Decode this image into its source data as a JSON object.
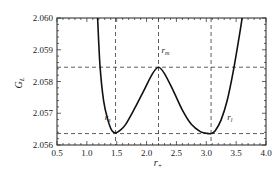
{
  "chart_data": {
    "type": "line",
    "title": "",
    "xlabel": "r+",
    "xlabel_main": "r",
    "xlabel_sub": "+",
    "ylabel": "GL",
    "ylabel_main": "G",
    "ylabel_sub": "L",
    "xlim": [
      0.5,
      4.0
    ],
    "ylim": [
      2.056,
      2.06
    ],
    "xticks": [
      "0.5",
      "1.0",
      "1.5",
      "2.0",
      "2.5",
      "3.0",
      "3.5",
      "4.0"
    ],
    "yticks": [
      "2.060",
      "2.059",
      "2.058",
      "2.057",
      "2.056"
    ],
    "grid": false,
    "legend": null,
    "series": [
      {
        "name": "G_L(r+)",
        "x": [
          1.18,
          1.22,
          1.28,
          1.35,
          1.42,
          1.48,
          1.55,
          1.65,
          1.8,
          1.95,
          2.1,
          2.2,
          2.3,
          2.45,
          2.6,
          2.75,
          2.9,
          3.0,
          3.08,
          3.15,
          3.25,
          3.35,
          3.45,
          3.55,
          3.6
        ],
        "y": [
          2.06,
          2.0585,
          2.0574,
          2.0568,
          2.05645,
          2.05638,
          2.05645,
          2.05665,
          2.05715,
          2.0577,
          2.05825,
          2.05845,
          2.05825,
          2.0577,
          2.0571,
          2.05665,
          2.05642,
          2.05637,
          2.05636,
          2.05645,
          2.0568,
          2.0574,
          2.0583,
          2.0594,
          2.06
        ]
      }
    ],
    "reference_lines": {
      "vertical_x": [
        1.48,
        2.2,
        3.08
      ],
      "horizontal_y": [
        2.05845,
        2.05636
      ],
      "style": "dashed"
    },
    "annotations": [
      {
        "text": "r_s",
        "main": "r",
        "sub": "s",
        "x": 1.3,
        "y": 2.0568
      },
      {
        "text": "r_m",
        "main": "r",
        "sub": "m",
        "x": 2.25,
        "y": 2.0589
      },
      {
        "text": "r_l",
        "main": "r",
        "sub": "l",
        "x": 3.35,
        "y": 2.0568
      }
    ]
  }
}
